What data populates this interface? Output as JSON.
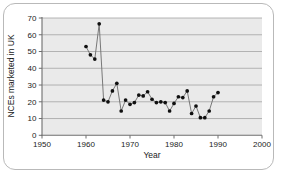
{
  "figure": {
    "frame": "rounded-rect-border",
    "background": "#ffffff",
    "plot_background": "#eaeaea"
  },
  "chart_data": {
    "type": "line",
    "title": "",
    "subtitle": "",
    "xlabel": "Year",
    "ylabel": "NCEs marketed in UK",
    "xlim": [
      1950,
      2000
    ],
    "ylim": [
      0,
      70
    ],
    "xticks": [
      1950,
      1960,
      1970,
      1980,
      1990,
      2000
    ],
    "yticks": [
      0,
      10,
      20,
      30,
      40,
      50,
      60,
      70
    ],
    "grid": "horizontal",
    "legend": "none",
    "marker": "filled-circle",
    "line_color": "#6b6b6b",
    "marker_color": "#101010",
    "x": [
      1960,
      1961,
      1962,
      1963,
      1964,
      1965,
      1966,
      1967,
      1968,
      1969,
      1970,
      1971,
      1972,
      1973,
      1974,
      1975,
      1976,
      1977,
      1978,
      1979,
      1980,
      1981,
      1982,
      1983,
      1984,
      1985,
      1986,
      1987,
      1988,
      1989,
      1990
    ],
    "values": [
      53,
      48,
      45.5,
      66.5,
      21,
      20,
      26.5,
      31,
      14.5,
      21,
      18.5,
      19.5,
      24,
      23.5,
      26,
      21.5,
      19.5,
      20,
      19.5,
      14.5,
      19,
      23,
      22.5,
      26.5,
      13,
      17.5,
      10.5,
      10.5,
      14.5,
      23,
      25.5
    ],
    "series": [
      {
        "name": "NCEs marketed in UK",
        "values": [
          53,
          48,
          45.5,
          66.5,
          21,
          20,
          26.5,
          31,
          14.5,
          21,
          18.5,
          19.5,
          24,
          23.5,
          26,
          21.5,
          19.5,
          20,
          19.5,
          14.5,
          19,
          23,
          22.5,
          26.5,
          13,
          17.5,
          10.5,
          10.5,
          14.5,
          23,
          25.5
        ]
      }
    ]
  }
}
